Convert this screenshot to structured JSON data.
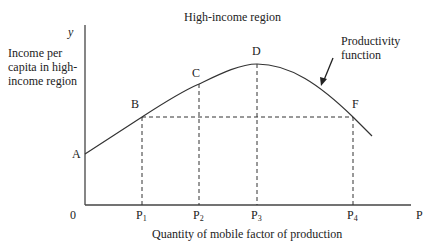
{
  "title": "High-income region",
  "y_axis": {
    "variable": "y",
    "label": "Income per capita in high-income region"
  },
  "x_axis": {
    "variable": "P",
    "label": "Quantity of mobile factor of production",
    "origin": "0",
    "ticks": [
      {
        "base": "P",
        "sub": "1"
      },
      {
        "base": "P",
        "sub": "2"
      },
      {
        "base": "P",
        "sub": "3"
      },
      {
        "base": "P",
        "sub": "4"
      }
    ]
  },
  "curve_label": "Productivity function",
  "points": [
    "A",
    "B",
    "C",
    "D",
    "F"
  ],
  "colors": {
    "line": "#333333",
    "background": "#ffffff"
  }
}
